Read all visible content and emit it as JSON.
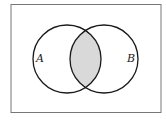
{
  "diagram": {
    "type": "venn",
    "sets": [
      {
        "label": "A",
        "cx": 67,
        "cy": 59,
        "r": 34
      },
      {
        "label": "B",
        "cx": 104,
        "cy": 59,
        "r": 34
      }
    ],
    "shaded_region": "A ∩ B",
    "colors": {
      "shade": "#d9d9d9",
      "stroke": "#1a1a1a",
      "frame": "#777777"
    }
  }
}
